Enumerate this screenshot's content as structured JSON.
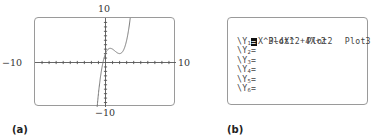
{
  "panel_a": {
    "caption": "(a)",
    "labels": {
      "y_max": "10",
      "y_min": "−10",
      "x_min": "−10",
      "x_max": "10"
    }
  },
  "panel_b": {
    "caption": "(b)",
    "plots": [
      "Plot1",
      "Plot2",
      "Plot3"
    ],
    "y_prefix": "\\Y",
    "y1_expression": "X^3−4X^2+4X+2",
    "rows": [
      {
        "sub": "2",
        "eq": "="
      },
      {
        "sub": "3",
        "eq": "="
      },
      {
        "sub": "4",
        "eq": "="
      },
      {
        "sub": "5",
        "eq": "="
      },
      {
        "sub": "6",
        "eq": "="
      }
    ],
    "y1_sub": "1"
  },
  "chart_data": {
    "type": "line",
    "title": "",
    "function": "y = x^3 - 4x^2 + 4x + 2",
    "xlim": [
      -10,
      10
    ],
    "ylim": [
      -10,
      10
    ],
    "x_tick_step": 1,
    "y_tick_step": 1,
    "grid": false,
    "tick_labels": {
      "x": [
        "-10",
        "10"
      ],
      "y": [
        "-10",
        "10"
      ]
    },
    "key_points": [
      {
        "x": -1,
        "y": -7
      },
      {
        "x": 0,
        "y": 2
      },
      {
        "x": 0.667,
        "y": 3.19
      },
      {
        "x": 2,
        "y": 2
      },
      {
        "x": 3,
        "y": 5
      },
      {
        "x": 3.5,
        "y": 10.1
      }
    ]
  }
}
